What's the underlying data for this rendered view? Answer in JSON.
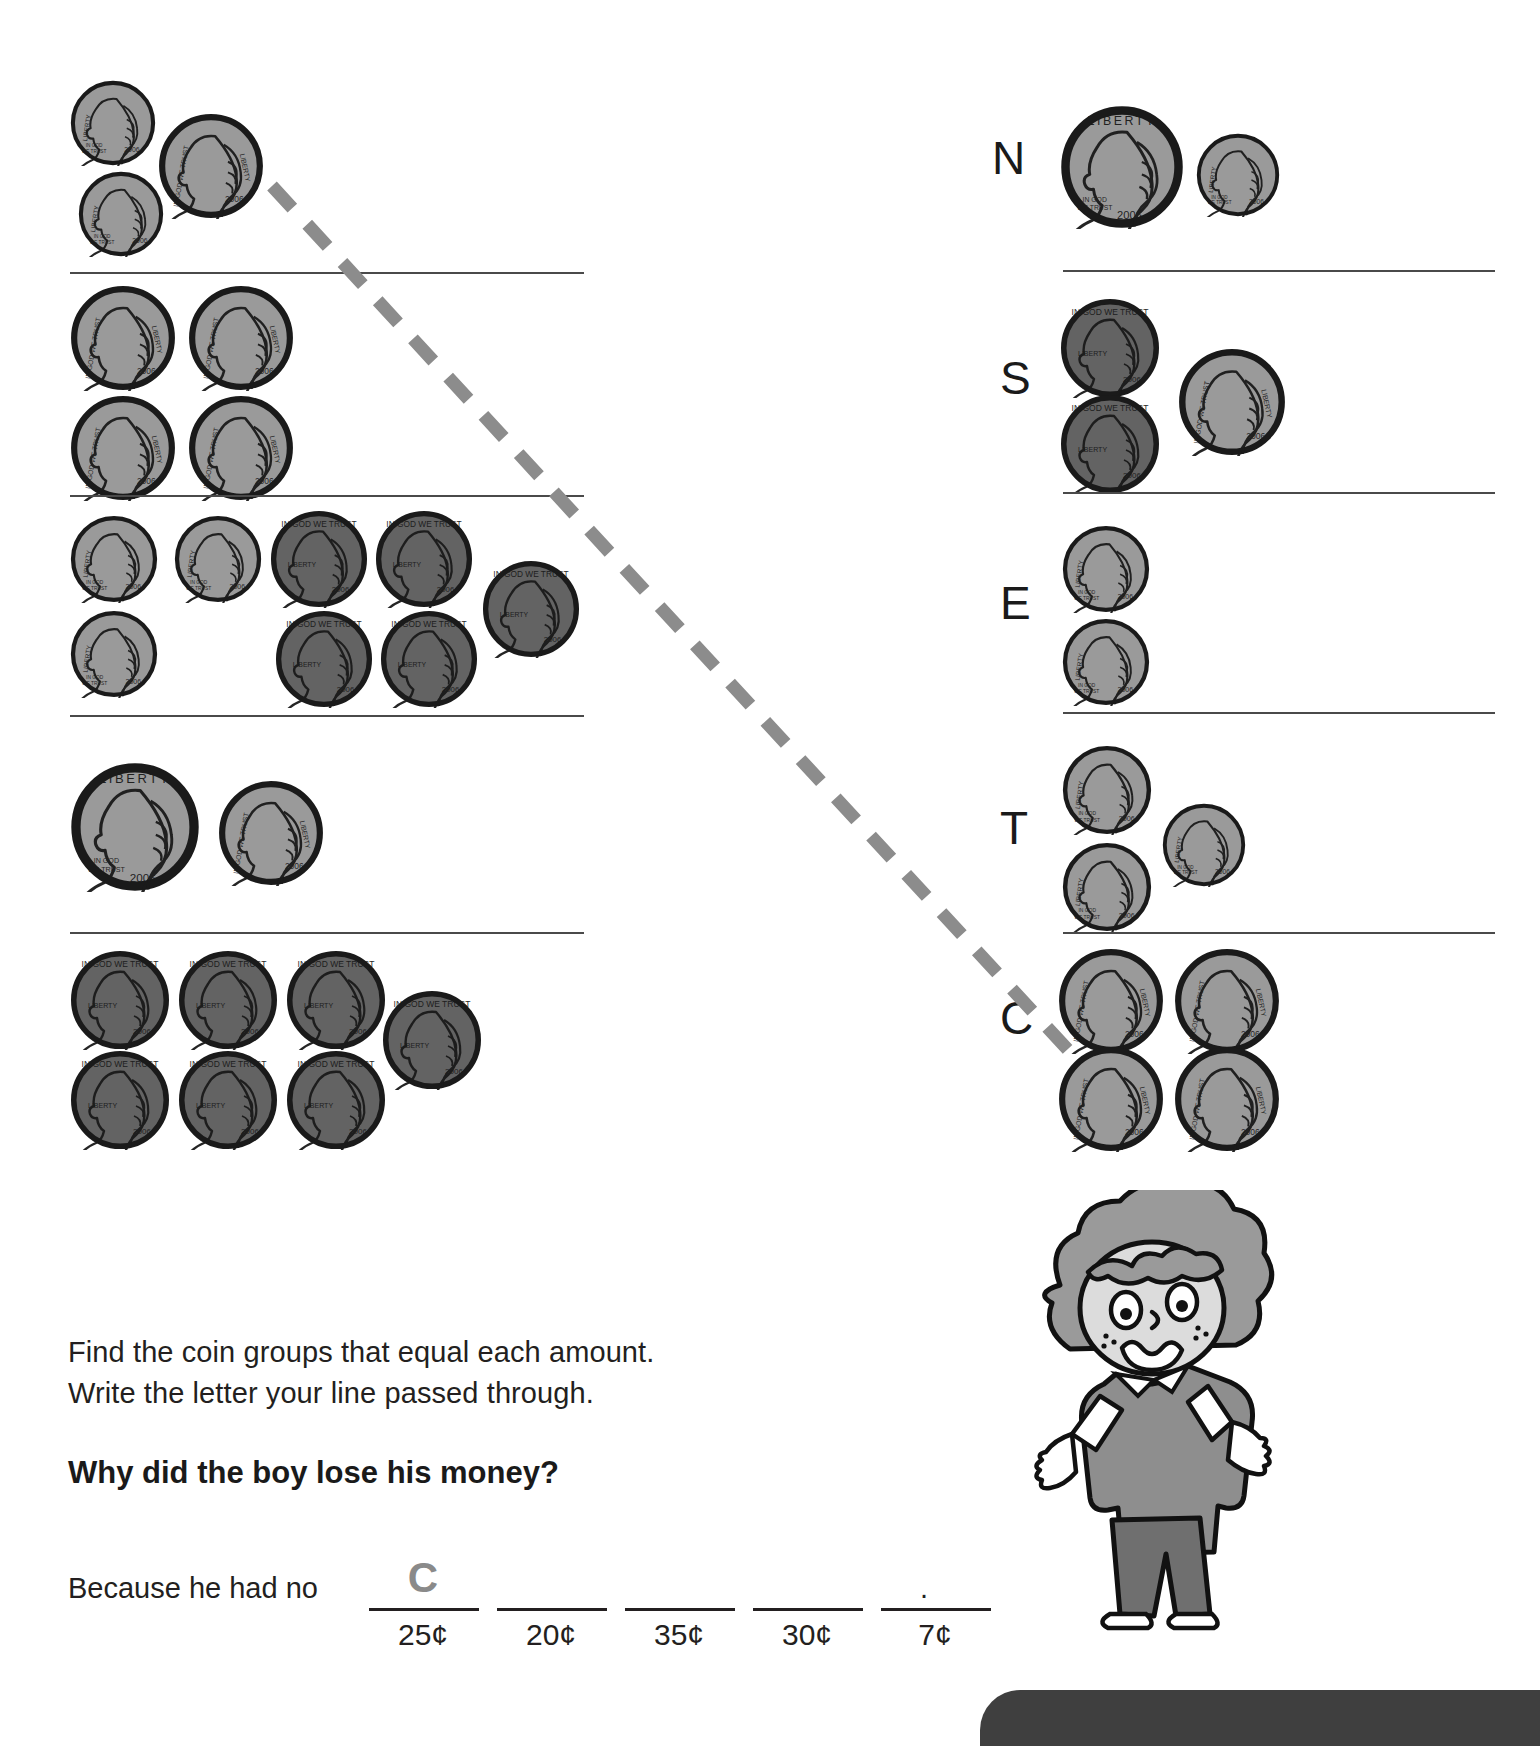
{
  "worksheet": {
    "instruction_line1": "Find the coin groups that equal each amount.",
    "instruction_line2": "Write the letter your line passed through.",
    "question": "Why did the boy lose his money?",
    "answer_prefix": "Because he had no",
    "period": ".",
    "answer_letters": [
      "C",
      "",
      "",
      "",
      ""
    ],
    "answer_amounts": [
      "25¢",
      "20¢",
      "35¢",
      "30¢",
      "7¢"
    ]
  },
  "colors": {
    "silver": "#9a9a9a",
    "silver_light": "#a8a8a8",
    "copper": "#636363",
    "copper_dark": "#4e4e4e",
    "outline": "#1a1a1a",
    "rule": "#4a4a4a",
    "dash": "#8c8c8c",
    "text": "#231f20",
    "boy_skin": "#d8d8d8",
    "boy_hair": "#9a9a9a",
    "boy_shirt": "#8e8e8e",
    "boy_pants": "#6f6f6f"
  },
  "left_groups": [
    {
      "id": "left-group-1",
      "value": "25¢",
      "coins": [
        {
          "type": "dime",
          "label": "LIBERTY",
          "year": "2006"
        },
        {
          "type": "dime",
          "label": "LIBERTY",
          "year": "2006"
        },
        {
          "type": "nickel",
          "label": "LIBERTY",
          "year": "2006"
        }
      ]
    },
    {
      "id": "left-group-2",
      "value": "20¢",
      "coins": [
        {
          "type": "nickel",
          "label": "LIBERTY",
          "year": "2006"
        },
        {
          "type": "nickel",
          "label": "LIBERTY",
          "year": "2006"
        },
        {
          "type": "nickel",
          "label": "LIBERTY",
          "year": "2006"
        },
        {
          "type": "nickel",
          "label": "LIBERTY",
          "year": "2006"
        }
      ]
    },
    {
      "id": "left-group-3",
      "value": "35¢",
      "coins": [
        {
          "type": "dime",
          "label": "LIBERTY",
          "year": "2006"
        },
        {
          "type": "dime",
          "label": "LIBERTY",
          "year": "2006"
        },
        {
          "type": "dime",
          "label": "LIBERTY",
          "year": "2006"
        },
        {
          "type": "penny",
          "label": "LIBERTY",
          "year": "2006"
        },
        {
          "type": "penny",
          "label": "LIBERTY",
          "year": "2006"
        },
        {
          "type": "penny",
          "label": "LIBERTY",
          "year": "2006"
        },
        {
          "type": "penny",
          "label": "LIBERTY",
          "year": "2006"
        },
        {
          "type": "penny",
          "label": "LIBERTY",
          "year": "2006"
        }
      ]
    },
    {
      "id": "left-group-4",
      "value": "30¢",
      "coins": [
        {
          "type": "quarter",
          "label": "LIBERTY",
          "year": "2006"
        },
        {
          "type": "nickel",
          "label": "LIBERTY",
          "year": "2006"
        }
      ]
    },
    {
      "id": "left-group-5",
      "value": "7¢",
      "coins": [
        {
          "type": "penny",
          "label": "LIBERTY",
          "year": "2006"
        },
        {
          "type": "penny",
          "label": "LIBERTY",
          "year": "2006"
        },
        {
          "type": "penny",
          "label": "LIBERTY",
          "year": "2006"
        },
        {
          "type": "penny",
          "label": "LIBERTY",
          "year": "2006"
        },
        {
          "type": "penny",
          "label": "LIBERTY",
          "year": "2006"
        },
        {
          "type": "penny",
          "label": "LIBERTY",
          "year": "2006"
        },
        {
          "type": "penny",
          "label": "LIBERTY",
          "year": "2006"
        }
      ]
    }
  ],
  "right_groups": [
    {
      "id": "right-group-n",
      "letter": "N",
      "value": "35¢",
      "coins": [
        {
          "type": "quarter",
          "label": "LIBERTY",
          "year": "2006"
        },
        {
          "type": "dime",
          "label": "LIBERTY",
          "year": "2006"
        }
      ]
    },
    {
      "id": "right-group-s",
      "letter": "S",
      "value": "7¢",
      "coins": [
        {
          "type": "penny",
          "label": "LIBERTY",
          "year": "2006"
        },
        {
          "type": "penny",
          "label": "LIBERTY",
          "year": "2006"
        },
        {
          "type": "nickel",
          "label": "LIBERTY",
          "year": "2006"
        }
      ]
    },
    {
      "id": "right-group-e",
      "letter": "E",
      "value": "20¢",
      "coins": [
        {
          "type": "dime",
          "label": "LIBERTY",
          "year": "2006"
        },
        {
          "type": "dime",
          "label": "LIBERTY",
          "year": "2006"
        }
      ]
    },
    {
      "id": "right-group-t",
      "letter": "T",
      "value": "30¢",
      "coins": [
        {
          "type": "dime",
          "label": "LIBERTY",
          "year": "2006"
        },
        {
          "type": "dime",
          "label": "LIBERTY",
          "year": "2006"
        },
        {
          "type": "dime",
          "label": "LIBERTY",
          "year": "2006"
        }
      ]
    },
    {
      "id": "right-group-c",
      "letter": "C",
      "value": "25¢",
      "coins": [
        {
          "type": "nickel",
          "label": "LIBERTY",
          "year": "2006"
        },
        {
          "type": "nickel",
          "label": "LIBERTY",
          "year": "2006"
        },
        {
          "type": "nickel",
          "label": "LIBERTY",
          "year": "2006"
        },
        {
          "type": "nickel",
          "label": "LIBERTY",
          "year": "2006"
        },
        {
          "type": "nickel",
          "label": "LIBERTY",
          "year": "2006"
        }
      ]
    }
  ],
  "drawn_line": {
    "description": "dashed line drawn from left group 1 to letter C",
    "from": "left-group-1",
    "to": "right-group-c"
  }
}
